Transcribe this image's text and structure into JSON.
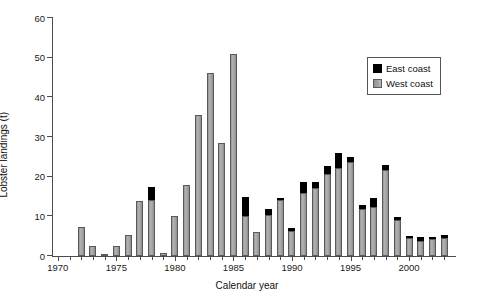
{
  "chart_data": {
    "type": "bar",
    "title": "",
    "xlabel": "Calendar year",
    "ylabel": "Lobster landings (t)",
    "ylim": [
      0,
      60
    ],
    "xlim": [
      1969.5,
      2003.5
    ],
    "yticks": [
      0,
      10,
      20,
      30,
      40,
      50,
      60
    ],
    "xticks_major": [
      1970,
      1975,
      1980,
      1985,
      1990,
      1995,
      2000
    ],
    "xtick_labels": [
      "1970",
      "1975",
      "1980",
      "1985",
      "1990",
      "1995",
      "2000"
    ],
    "grid": false,
    "stacked": true,
    "legend_position": "top-right",
    "categories": [
      1970,
      1971,
      1972,
      1973,
      1974,
      1975,
      1976,
      1977,
      1978,
      1979,
      1980,
      1981,
      1982,
      1983,
      1984,
      1985,
      1986,
      1987,
      1988,
      1989,
      1990,
      1991,
      1992,
      1993,
      1994,
      1995,
      1996,
      1997,
      1998,
      1999,
      2000,
      2001,
      2002,
      2003
    ],
    "series": [
      {
        "name": "West coast",
        "color": "#a8a8a8",
        "values": [
          0,
          0,
          7.4,
          2.5,
          0.6,
          2.6,
          5.2,
          13.8,
          14.0,
          0.7,
          10.2,
          18.0,
          35.6,
          46.2,
          28.4,
          51.0,
          10.0,
          6.0,
          10.3,
          14.0,
          6.2,
          15.8,
          17.2,
          20.6,
          22.2,
          23.8,
          11.9,
          12.3,
          21.8,
          9.2,
          4.5,
          3.8,
          4.2,
          4.6
        ]
      },
      {
        "name": "East coast",
        "color": "#000000",
        "values": [
          0,
          0,
          0,
          0,
          0,
          0,
          0,
          0,
          3.3,
          0,
          0,
          0,
          0,
          0,
          0,
          0,
          4.8,
          0,
          1.5,
          0.5,
          0.9,
          2.9,
          1.4,
          2.2,
          3.8,
          1.2,
          0.9,
          2.3,
          1.1,
          0.7,
          0.6,
          0.9,
          0.5,
          0.8
        ]
      }
    ],
    "totals": [
      0,
      0,
      7.4,
      2.5,
      0.6,
      2.6,
      5.2,
      13.8,
      17.3,
      0.7,
      10.2,
      18.0,
      35.6,
      46.2,
      28.4,
      51.0,
      14.8,
      6.0,
      11.8,
      14.5,
      7.1,
      18.7,
      18.6,
      22.8,
      26.0,
      25.0,
      12.8,
      14.6,
      22.9,
      9.9,
      5.1,
      4.7,
      4.7,
      5.4
    ]
  },
  "legend": {
    "entries": [
      {
        "label": "East coast",
        "swatch": "black-square-icon"
      },
      {
        "label": "West coast",
        "swatch": "gray-square-icon"
      }
    ]
  }
}
